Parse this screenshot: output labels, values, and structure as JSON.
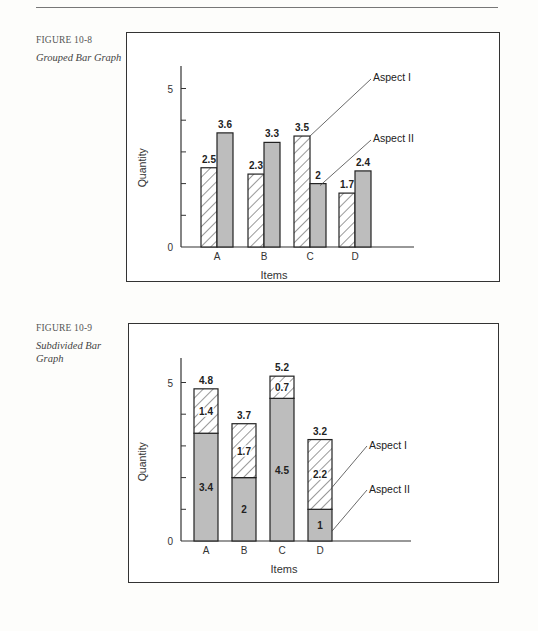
{
  "figures": [
    {
      "number": "FIGURE 10-8",
      "title": "Grouped Bar Graph"
    },
    {
      "number": "FIGURE 10-9",
      "title": "Subdivided Bar Graph"
    }
  ],
  "chart_data": [
    {
      "type": "bar",
      "subtype": "grouped",
      "title": "Grouped Bar Graph",
      "xlabel": "Items",
      "ylabel": "Quantity",
      "categories": [
        "A",
        "B",
        "C",
        "D"
      ],
      "series": [
        {
          "name": "Aspect I",
          "pattern": "hatched",
          "values": [
            2.5,
            2.3,
            3.5,
            1.7
          ],
          "labels": [
            "2.5",
            "2.3",
            "3.5",
            "1.7"
          ]
        },
        {
          "name": "Aspect II",
          "pattern": "gray",
          "values": [
            3.6,
            3.3,
            2,
            2.4
          ],
          "labels": [
            "3.6",
            "3.3",
            "2",
            "2.4"
          ]
        }
      ],
      "yticks": [
        0,
        1,
        2,
        3,
        4,
        5
      ],
      "ytick_labels": [
        "0",
        "5"
      ],
      "ylim": [
        0,
        5.8
      ],
      "legend_annotations": [
        "Aspect I",
        "Aspect II"
      ],
      "grid": false
    },
    {
      "type": "bar",
      "subtype": "stacked",
      "title": "Subdivided Bar Graph",
      "xlabel": "Items",
      "ylabel": "Quantity",
      "categories": [
        "A",
        "B",
        "C",
        "D"
      ],
      "series": [
        {
          "name": "Aspect II",
          "pattern": "gray",
          "position": "bottom",
          "values": [
            3.4,
            2,
            4.5,
            1
          ],
          "labels": [
            "3.4",
            "2",
            "4.5",
            "1"
          ]
        },
        {
          "name": "Aspect I",
          "pattern": "hatched",
          "position": "top",
          "values": [
            1.4,
            1.7,
            0.7,
            2.2
          ],
          "labels": [
            "1.4",
            "1.7",
            "0.7",
            "2.2"
          ]
        }
      ],
      "totals": [
        4.8,
        3.7,
        5.2,
        3.2
      ],
      "total_labels": [
        "4.8",
        "3.7",
        "5.2",
        "3.2"
      ],
      "yticks": [
        0,
        1,
        2,
        3,
        4,
        5
      ],
      "ytick_labels": [
        "0",
        "5"
      ],
      "ylim": [
        0,
        5.8
      ],
      "legend_annotations": [
        "Aspect I",
        "Aspect II"
      ],
      "grid": false
    }
  ],
  "colors": {
    "gray_fill": "#bdbdbd",
    "hatch_line": "#333333",
    "outline": "#222222"
  }
}
